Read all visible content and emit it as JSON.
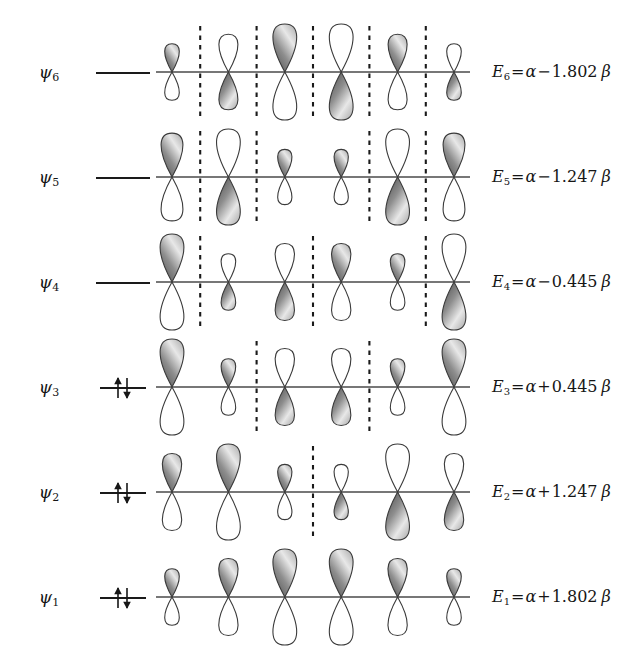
{
  "figure": {
    "n_atoms": 6,
    "colors": {
      "ink": "#161616",
      "lobe_stroke": "#3a3a3a",
      "lobe_shaded_dark": "#4a4a4a",
      "lobe_shaded_light": "#e8e8e8",
      "lobe_empty": "#ffffff",
      "node_line": "#1a1a1a",
      "axis": "#4a4a4a"
    }
  },
  "rows": [
    {
      "psi": "ψ",
      "psi_sub": "6",
      "name": "psi-6",
      "occupancy": 0,
      "nodes": 5,
      "energy": {
        "symbol": "E",
        "sub": "6",
        "equals": "=",
        "alpha": "α",
        "op": "−",
        "coefficient": "1.802",
        "beta": "β",
        "text": "E6 = α − 1.802 β"
      },
      "lobes": [
        {
          "size": 0.42,
          "phase": "up"
        },
        {
          "size": 0.7,
          "phase": "down"
        },
        {
          "size": 1.0,
          "phase": "up"
        },
        {
          "size": 1.0,
          "phase": "down"
        },
        {
          "size": 0.7,
          "phase": "up"
        },
        {
          "size": 0.42,
          "phase": "down"
        }
      ]
    },
    {
      "psi": "ψ",
      "psi_sub": "5",
      "name": "psi-5",
      "occupancy": 0,
      "nodes": 4,
      "energy": {
        "symbol": "E",
        "sub": "5",
        "equals": "=",
        "alpha": "α",
        "op": "−",
        "coefficient": "1.247",
        "beta": "β",
        "text": "E5 = α − 1.247 β"
      },
      "lobes": [
        {
          "size": 0.88,
          "phase": "up"
        },
        {
          "size": 1.0,
          "phase": "down"
        },
        {
          "size": 0.4,
          "phase": "up"
        },
        {
          "size": 0.4,
          "phase": "up"
        },
        {
          "size": 1.0,
          "phase": "down"
        },
        {
          "size": 0.88,
          "phase": "up"
        }
      ]
    },
    {
      "psi": "ψ",
      "psi_sub": "4",
      "name": "psi-4",
      "occupancy": 0,
      "nodes": 3,
      "energy": {
        "symbol": "E",
        "sub": "4",
        "equals": "=",
        "alpha": "α",
        "op": "−",
        "coefficient": "0.445",
        "beta": "β",
        "text": "E4 = α − 0.445 β"
      },
      "lobes": [
        {
          "size": 1.0,
          "phase": "up"
        },
        {
          "size": 0.42,
          "phase": "down"
        },
        {
          "size": 0.72,
          "phase": "down"
        },
        {
          "size": 0.72,
          "phase": "up"
        },
        {
          "size": 0.42,
          "phase": "up"
        },
        {
          "size": 1.0,
          "phase": "down"
        }
      ]
    },
    {
      "psi": "ψ",
      "psi_sub": "3",
      "name": "psi-3",
      "occupancy": 2,
      "nodes": 2,
      "energy": {
        "symbol": "E",
        "sub": "3",
        "equals": "=",
        "alpha": "α",
        "op": "+",
        "coefficient": "0.445",
        "beta": "β",
        "text": "E3 = α + 0.445 β"
      },
      "lobes": [
        {
          "size": 1.0,
          "phase": "up"
        },
        {
          "size": 0.42,
          "phase": "up"
        },
        {
          "size": 0.72,
          "phase": "down"
        },
        {
          "size": 0.72,
          "phase": "down"
        },
        {
          "size": 0.42,
          "phase": "up"
        },
        {
          "size": 1.0,
          "phase": "up"
        }
      ]
    },
    {
      "psi": "ψ",
      "psi_sub": "2",
      "name": "psi-2",
      "occupancy": 2,
      "nodes": 1,
      "energy": {
        "symbol": "E",
        "sub": "2",
        "equals": "=",
        "alpha": "α",
        "op": "+",
        "coefficient": "1.247",
        "beta": "β",
        "text": "E2 = α + 1.247 β"
      },
      "lobes": [
        {
          "size": 0.72,
          "phase": "up"
        },
        {
          "size": 1.0,
          "phase": "up"
        },
        {
          "size": 0.4,
          "phase": "up"
        },
        {
          "size": 0.4,
          "phase": "down"
        },
        {
          "size": 1.0,
          "phase": "down"
        },
        {
          "size": 0.72,
          "phase": "down"
        }
      ]
    },
    {
      "psi": "ψ",
      "psi_sub": "1",
      "name": "psi-1",
      "occupancy": 2,
      "nodes": 0,
      "energy": {
        "symbol": "E",
        "sub": "1",
        "equals": "=",
        "alpha": "α",
        "op": "+",
        "coefficient": "1.802",
        "beta": "β",
        "text": "E1 = α + 1.802 β"
      },
      "lobes": [
        {
          "size": 0.42,
          "phase": "up"
        },
        {
          "size": 0.72,
          "phase": "up"
        },
        {
          "size": 1.0,
          "phase": "up"
        },
        {
          "size": 1.0,
          "phase": "up"
        },
        {
          "size": 0.72,
          "phase": "up"
        },
        {
          "size": 0.42,
          "phase": "up"
        }
      ]
    }
  ]
}
